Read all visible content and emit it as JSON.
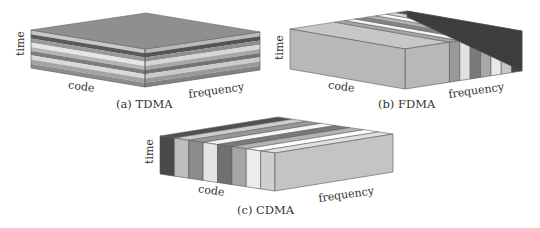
{
  "figure": {
    "panels": [
      {
        "id": "tdma",
        "caption": "(a)  TDMA",
        "axis_labels": {
          "time": "time",
          "code": "code",
          "frequency": "frequency"
        },
        "division_axis": "time",
        "slices": [
          "#c8c8c8",
          "#5a5a5a",
          "#9a9a9a",
          "#e6e6e6",
          "#b4b4b4",
          "#7c7c7c",
          "#d9d9d9",
          "#a4a4a4",
          "#8c8c8c"
        ],
        "top_color": "#8f8f8f"
      },
      {
        "id": "fdma",
        "caption": "(b)  FDMA",
        "axis_labels": {
          "time": "time",
          "code": "code",
          "frequency": "frequency"
        },
        "division_axis": "frequency",
        "slices": [
          "#b8b8b8",
          "#999999",
          "#e2e2e2",
          "#7a7a7a",
          "#a8a8a8",
          "#e8e8e8",
          "#c6c6c6",
          "#444444"
        ],
        "top_color": "#c0c0c0"
      },
      {
        "id": "cdma",
        "caption": "(c)  CDMA",
        "axis_labels": {
          "time": "time",
          "code": "code",
          "frequency": "frequency"
        },
        "division_axis": "code",
        "slices": [
          "#4a4a4a",
          "#bdbdbd",
          "#8c8c8c",
          "#e4e4e4",
          "#707070",
          "#a6a6a6",
          "#ececec",
          "#cfcfcf"
        ],
        "top_color": "#c4c4c4"
      }
    ]
  }
}
